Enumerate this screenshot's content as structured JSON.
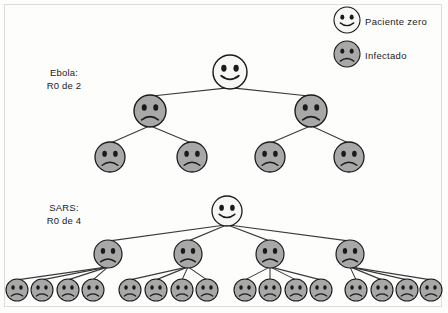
{
  "diagram": {
    "title_hidden": "",
    "background_color": "#fdfdfb",
    "border_color": "#dcdcd8",
    "node_colors": {
      "patient_zero_fill": "#f7f7f5",
      "infected_fill": "#a8a8a8",
      "outline": "#1a1a1a",
      "edge": "#3a3a3a"
    }
  },
  "legend": {
    "items": [
      {
        "icon": "smiley-face-icon",
        "label": "Paciente zero",
        "fill": "#f7f7f5",
        "face": "happy"
      },
      {
        "icon": "sad-face-icon",
        "label": "Infectado",
        "fill": "#a8a8a8",
        "face": "sad"
      }
    ]
  },
  "trees": [
    {
      "id": "ebola",
      "label_line1": "Ebola:",
      "label_line2": "R0 de 2",
      "branching_factor": 2,
      "levels": 3,
      "counts": [
        1,
        2,
        4
      ],
      "total_infected": 6,
      "nodes": {
        "root": {
          "face": "happy",
          "x": 230,
          "y": 72,
          "r": 17
        },
        "level1": [
          {
            "face": "sad",
            "x": 150,
            "y": 111,
            "r": 16
          },
          {
            "face": "sad",
            "x": 311,
            "y": 111,
            "r": 16
          }
        ],
        "level2": [
          {
            "face": "sad",
            "x": 110,
            "y": 157,
            "r": 15
          },
          {
            "face": "sad",
            "x": 192,
            "y": 157,
            "r": 15
          },
          {
            "face": "sad",
            "x": 270,
            "y": 157,
            "r": 15
          },
          {
            "face": "sad",
            "x": 349,
            "y": 157,
            "r": 15
          }
        ]
      }
    },
    {
      "id": "sars",
      "label_line1": "SARS:",
      "label_line2": "R0 de 4",
      "branching_factor": 4,
      "levels": 3,
      "counts": [
        1,
        4,
        16
      ],
      "total_infected": 20,
      "nodes": {
        "root": {
          "face": "happy",
          "x": 227,
          "y": 211,
          "r": 15
        },
        "level1": [
          {
            "face": "sad",
            "x": 108,
            "y": 254,
            "r": 14
          },
          {
            "face": "sad",
            "x": 188,
            "y": 254,
            "r": 14
          },
          {
            "face": "sad",
            "x": 270,
            "y": 254,
            "r": 14
          },
          {
            "face": "sad",
            "x": 350,
            "y": 254,
            "r": 14
          }
        ],
        "level2": [
          {
            "face": "sad",
            "x": 17,
            "y": 290,
            "r": 11
          },
          {
            "face": "sad",
            "x": 42,
            "y": 290,
            "r": 11
          },
          {
            "face": "sad",
            "x": 68,
            "y": 290,
            "r": 11
          },
          {
            "face": "sad",
            "x": 93,
            "y": 290,
            "r": 11
          },
          {
            "face": "sad",
            "x": 130,
            "y": 290,
            "r": 11
          },
          {
            "face": "sad",
            "x": 156,
            "y": 290,
            "r": 11
          },
          {
            "face": "sad",
            "x": 182,
            "y": 290,
            "r": 11
          },
          {
            "face": "sad",
            "x": 207,
            "y": 290,
            "r": 11
          },
          {
            "face": "sad",
            "x": 245,
            "y": 290,
            "r": 11
          },
          {
            "face": "sad",
            "x": 270,
            "y": 290,
            "r": 11
          },
          {
            "face": "sad",
            "x": 296,
            "y": 290,
            "r": 11
          },
          {
            "face": "sad",
            "x": 321,
            "y": 290,
            "r": 11
          },
          {
            "face": "sad",
            "x": 356,
            "y": 290,
            "r": 11
          },
          {
            "face": "sad",
            "x": 382,
            "y": 290,
            "r": 11
          },
          {
            "face": "sad",
            "x": 407,
            "y": 290,
            "r": 11
          },
          {
            "face": "sad",
            "x": 431,
            "y": 290,
            "r": 11
          }
        ]
      }
    }
  ]
}
